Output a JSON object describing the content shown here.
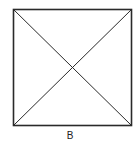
{
  "diagram": {
    "type": "square-with-diagonals",
    "label": "B",
    "stroke_color": "#2a2a2a",
    "background": "#ffffff"
  }
}
